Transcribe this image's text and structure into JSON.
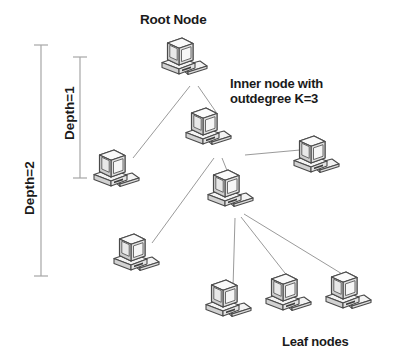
{
  "figure": {
    "background_color": "#ffffff",
    "width": 395,
    "height": 362
  },
  "labels": {
    "root_node": "Root Node",
    "inner_node_line1": "Inner node with",
    "inner_node_line2": "outdegree K=3",
    "leaf_nodes": "Leaf nodes",
    "depth_1": "Depth=1",
    "depth_2": "Depth=2"
  },
  "brackets": [
    {
      "name": "depth-2-bracket",
      "label": "Depth=2",
      "x": 41,
      "y_top": 45,
      "y_bottom": 276,
      "tick_half_width": 7,
      "color": "#a6a6a6"
    },
    {
      "name": "depth-1-bracket",
      "label": "Depth=1",
      "x": 80,
      "y_top": 57,
      "y_bottom": 178,
      "tick_half_width": 7,
      "color": "#a6a6a6"
    }
  ],
  "nodes": [
    {
      "id": "root",
      "role": "root",
      "label": "Root Node",
      "x": 184,
      "y": 58,
      "scale": 1.0
    },
    {
      "id": "inner",
      "role": "inner",
      "label": "Inner node K=3",
      "x": 208,
      "y": 130,
      "scale": 1.0
    },
    {
      "id": "leafA",
      "role": "leaf",
      "label": "Leaf node left",
      "x": 116,
      "y": 172,
      "scale": 1.0
    },
    {
      "id": "mid",
      "role": "inner",
      "label": "Inner node middle",
      "x": 230,
      "y": 192,
      "scale": 1.0
    },
    {
      "id": "leafB",
      "role": "leaf",
      "label": "Leaf node right",
      "x": 316,
      "y": 158,
      "scale": 1.0
    },
    {
      "id": "leafC",
      "role": "leaf",
      "label": "Leaf node lower-left",
      "x": 136,
      "y": 256,
      "scale": 1.0
    },
    {
      "id": "leafD",
      "role": "leaf",
      "label": "Leaf node bottom 1",
      "x": 228,
      "y": 302,
      "scale": 1.0
    },
    {
      "id": "leafE",
      "role": "leaf",
      "label": "Leaf node bottom 2",
      "x": 288,
      "y": 296,
      "scale": 1.0
    },
    {
      "id": "leafF",
      "role": "leaf",
      "label": "Leaf node bottom 3",
      "x": 348,
      "y": 294,
      "scale": 1.0
    }
  ],
  "edges": [
    {
      "from": "root",
      "to": "leafA"
    },
    {
      "from": "root",
      "to": "inner"
    },
    {
      "from": "inner",
      "to": "leafB"
    },
    {
      "from": "inner",
      "to": "mid"
    },
    {
      "from": "inner",
      "to": "leafC"
    },
    {
      "from": "mid",
      "to": "leafD"
    },
    {
      "from": "mid",
      "to": "leafE"
    },
    {
      "from": "mid",
      "to": "leafF"
    }
  ],
  "colors": {
    "edge": "#9a9a9a",
    "bracket": "#a6a6a6",
    "text": "#1a1a1a",
    "icon_outline": "#3d3d3d",
    "icon_light": "#f2f2f2",
    "icon_mid": "#d9d9d9",
    "icon_shadow": "#bfbfbf",
    "screen": "#ececec"
  }
}
